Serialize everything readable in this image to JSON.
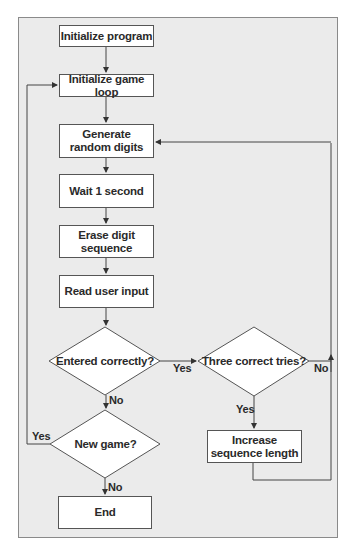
{
  "diagram": {
    "type": "flowchart",
    "nodes": [
      {
        "id": "init_program",
        "shape": "process",
        "label": "Initialize program"
      },
      {
        "id": "init_loop",
        "shape": "process",
        "label": "Initialize game loop"
      },
      {
        "id": "generate",
        "shape": "process",
        "label": "Generate random digits",
        "line1": "Generate",
        "line2": "random digits"
      },
      {
        "id": "wait",
        "shape": "process",
        "label": "Wait 1 second"
      },
      {
        "id": "erase",
        "shape": "process",
        "label": "Erase digit sequence"
      },
      {
        "id": "read",
        "shape": "process",
        "label": "Read user input"
      },
      {
        "id": "entered_correctly",
        "shape": "decision",
        "label": "Entered correctly?"
      },
      {
        "id": "three_tries",
        "shape": "decision",
        "label": "Three correct tries?"
      },
      {
        "id": "increase",
        "shape": "process",
        "label": "Increase sequence length",
        "line1": "Increase",
        "line2": "sequence length"
      },
      {
        "id": "new_game",
        "shape": "decision",
        "label": "New game?"
      },
      {
        "id": "end",
        "shape": "process",
        "label": "End"
      }
    ],
    "edges": [
      {
        "from": "init_program",
        "to": "init_loop",
        "label": ""
      },
      {
        "from": "init_loop",
        "to": "generate",
        "label": ""
      },
      {
        "from": "generate",
        "to": "wait",
        "label": ""
      },
      {
        "from": "wait",
        "to": "erase",
        "label": ""
      },
      {
        "from": "erase",
        "to": "read",
        "label": ""
      },
      {
        "from": "read",
        "to": "entered_correctly",
        "label": ""
      },
      {
        "from": "entered_correctly",
        "to": "three_tries",
        "label": "Yes"
      },
      {
        "from": "entered_correctly",
        "to": "new_game",
        "label": "No"
      },
      {
        "from": "three_tries",
        "to": "increase",
        "label": "Yes"
      },
      {
        "from": "three_tries",
        "to": "generate",
        "label": "No"
      },
      {
        "from": "increase",
        "to": "generate",
        "label": ""
      },
      {
        "from": "new_game",
        "to": "init_loop",
        "label": "Yes"
      },
      {
        "from": "new_game",
        "to": "end",
        "label": "No"
      }
    ],
    "edge_labels": {
      "yes_right": "Yes",
      "no_down_1": "No",
      "no_right": "No",
      "yes_down_2": "Yes",
      "yes_left": "Yes",
      "no_down_2": "No"
    }
  },
  "colors": {
    "frame_bg": "#ebebeb",
    "box_fill": "#ffffff",
    "stroke": "#555555",
    "text": "#2a2a2a"
  }
}
